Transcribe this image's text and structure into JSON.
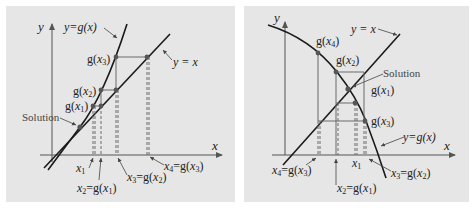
{
  "colors": {
    "background": "#ffffff",
    "panel": "#e6e6e6",
    "curve": "#1a1a1a",
    "guide": "#6a6a6a",
    "point": "#555555",
    "axis": "#555555"
  },
  "left_panel": {
    "axis_x_label": "x",
    "axis_y_label": "y",
    "curve_label": "y = g(x)",
    "line_label": "y = x",
    "solution_label": "Solution",
    "g_labels": [
      "g(x1)",
      "g(x2)",
      "g(x3)"
    ],
    "x_labels": [
      "x1",
      "x2 = g(x1)",
      "x3 = g(x2)",
      "x4 = g(x3)"
    ],
    "description": "Monotone divergence: iterates move away from the fixed point"
  },
  "right_panel": {
    "axis_x_label": "x",
    "axis_y_label": "y",
    "curve_label": "y = g(x)",
    "line_label": "y = x",
    "solution_label": "Solution",
    "g_labels": [
      "g(x1)",
      "g(x2)",
      "g(x3)",
      "g(x4)"
    ],
    "x_labels": [
      "x1",
      "x2 = g(x1)",
      "x3 = g(x2)",
      "x4 = g(x3)"
    ],
    "description": "Oscillating divergence: iterates spiral outward from the fixed point"
  }
}
